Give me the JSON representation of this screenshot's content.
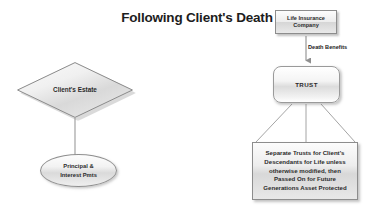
{
  "diagram": {
    "title": "Following Client's Death",
    "background_color": "#ffffff",
    "text_color": "#2b2b2b",
    "nodes": {
      "life_insurance_company": {
        "label": "Life Insurance Company",
        "line1": "Life Insurance",
        "line2": "Company",
        "shape": "rectangle"
      },
      "trust": {
        "label": "TRUST",
        "shape": "rounded-rectangle"
      },
      "separate_trusts": {
        "label": "Separate Trusts for Client's Descendants for Life unless otherwise modified, then Passed On for Future Generations Asset Protected",
        "line1": "Separate Trusts for Client's",
        "line2": "Descendants for Life unless",
        "line3": "otherwise modified, then",
        "line4": "Passed On for Future",
        "line5": "Generations Asset Protected",
        "shape": "rectangle"
      },
      "clients_estate": {
        "label": "Client's Estate",
        "shape": "diamond"
      },
      "principal_interest": {
        "label": "Principal & Interest Pmts",
        "line1": "Principal &",
        "line2": "Interest Pmts",
        "shape": "ellipse"
      }
    },
    "edges": {
      "death_benefits": {
        "label": "Death Benefits",
        "from": "life_insurance_company",
        "to": "trust",
        "arrow": "down-arrowhead"
      },
      "estate_to_pmts": {
        "label": "",
        "from": "clients_estate",
        "to": "principal_interest",
        "arrow": "none"
      },
      "trust_to_separate_left": {
        "label": "",
        "from": "trust",
        "to": "separate_trusts",
        "arrow": "none"
      },
      "trust_to_separate_center": {
        "label": "",
        "from": "trust",
        "to": "separate_trusts",
        "arrow": "none"
      },
      "trust_to_separate_right": {
        "label": "",
        "from": "trust",
        "to": "separate_trusts",
        "arrow": "none"
      }
    }
  }
}
